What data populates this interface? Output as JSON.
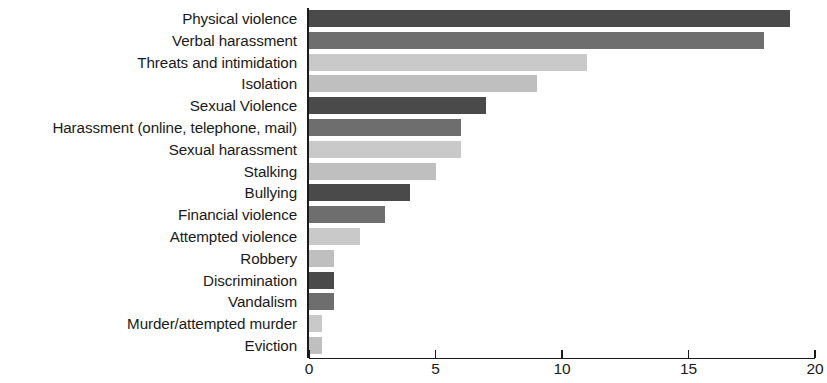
{
  "chart_data": {
    "type": "bar",
    "orientation": "horizontal",
    "title": "",
    "xlabel": "",
    "ylabel": "",
    "xlim": [
      0,
      20
    ],
    "xticks": [
      0,
      5,
      10,
      15,
      20
    ],
    "xtick_labels": [
      "0",
      "5",
      "10",
      "15",
      "20"
    ],
    "grid": false,
    "legend": "none",
    "categories": [
      "Physical violence",
      "Verbal harassment",
      "Threats and intimidation",
      "Isolation",
      "Sexual Violence",
      "Harassment (online, telephone, mail)",
      "Sexual harassment",
      "Stalking",
      "Bullying",
      "Financial violence",
      "Attempted violence",
      "Robbery",
      "Discrimination",
      "Vandalism",
      "Murder/attempted murder",
      "Eviction"
    ],
    "values": [
      19,
      18,
      11,
      9,
      7,
      6,
      6,
      5,
      4,
      3,
      2,
      1,
      1,
      1,
      0.5,
      0.5
    ],
    "bar_colors": [
      "#4a4a4a",
      "#6e6e6e",
      "#c9c9c9",
      "#bfbfbf",
      "#4a4a4a",
      "#6e6e6e",
      "#c9c9c9",
      "#bfbfbf",
      "#4a4a4a",
      "#6e6e6e",
      "#c9c9c9",
      "#bfbfbf",
      "#4a4a4a",
      "#6e6e6e",
      "#c9c9c9",
      "#bfbfbf"
    ],
    "axis_color": "#1a1a1a",
    "label_color": "#1a1a1a",
    "background": "#ffffff"
  }
}
